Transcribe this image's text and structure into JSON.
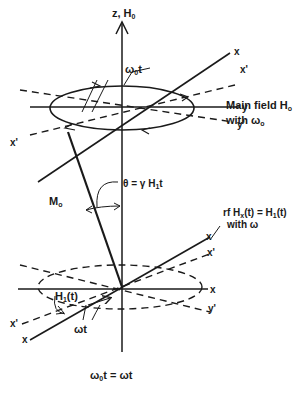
{
  "diagram": {
    "type": "rotating-frame magnetization diagram",
    "axis_z_label": "z, H",
    "axis_z_sub": "0",
    "top_frame": {
      "x_label": "x",
      "x_prime_label": "x'",
      "y_label": "y",
      "y_prime_label": "y'",
      "x_prime_left_label": "x'",
      "angle_label": "ω",
      "angle_sub": "0",
      "angle_suffix": "t",
      "caption_line1": "Main field H",
      "caption_line1_sub": "o",
      "caption_line2": "with ω",
      "caption_line2_sub": "o"
    },
    "magnetization_label": "M",
    "magnetization_sub": "o",
    "theta_label": "θ = γ H",
    "theta_sub": "1",
    "theta_suffix": "t",
    "bottom_frame": {
      "x_label": "x",
      "x_prime_label": "x'",
      "x_axis_label": "x",
      "y_prime_label": "y'",
      "x_left_label": "x",
      "x_prime_left_label": "x'",
      "h1_label": "H",
      "h1_sub": "1",
      "h1_suffix": "(t)",
      "angle_label": "ωt",
      "caption_line1": "rf H",
      "caption_line1_sub": "x",
      "caption_line1_suffix": "(t) = H",
      "caption_line1_sub2": "1",
      "caption_line1_end": "(t)",
      "caption_line2": "with ω"
    },
    "bottom_caption": "ω",
    "bottom_caption_sub": "0",
    "bottom_caption_suffix": "t = ωt"
  }
}
